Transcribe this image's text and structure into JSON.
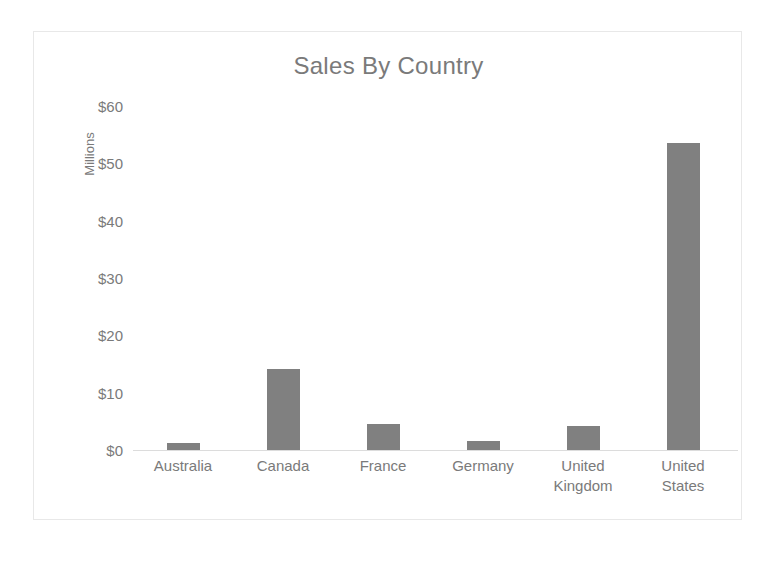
{
  "chart_data": {
    "type": "bar",
    "title": "Sales By Country",
    "xlabel": "",
    "ylabel": "Millions",
    "categories": [
      "Australia",
      "Canada",
      "France",
      "Germany",
      "United Kingdom",
      "United States"
    ],
    "category_lines": [
      [
        "Australia"
      ],
      [
        "Canada"
      ],
      [
        "France"
      ],
      [
        "Germany"
      ],
      [
        "United",
        "Kingdom"
      ],
      [
        "United",
        "States"
      ]
    ],
    "values": [
      1.3,
      14.2,
      4.6,
      1.5,
      4.2,
      53.5
    ],
    "ylim": [
      0,
      60
    ],
    "ytick_values": [
      0,
      10,
      20,
      30,
      40,
      50,
      60
    ],
    "ytick_labels": [
      "$0",
      "$10",
      "$20",
      "$30",
      "$40",
      "$50",
      "$60"
    ],
    "grid": false,
    "legend": false,
    "series": [
      {
        "name": "Sales",
        "values": [
          1.3,
          14.2,
          4.6,
          1.5,
          4.2,
          53.5
        ]
      }
    ],
    "colors": {
      "bar": "#808080",
      "title_text": "#7a7a7a",
      "tick_text": "#7a7a7a",
      "axis_line": "#dcdcdc",
      "frame_border": "#e8e8e8",
      "background": "#ffffff"
    }
  }
}
